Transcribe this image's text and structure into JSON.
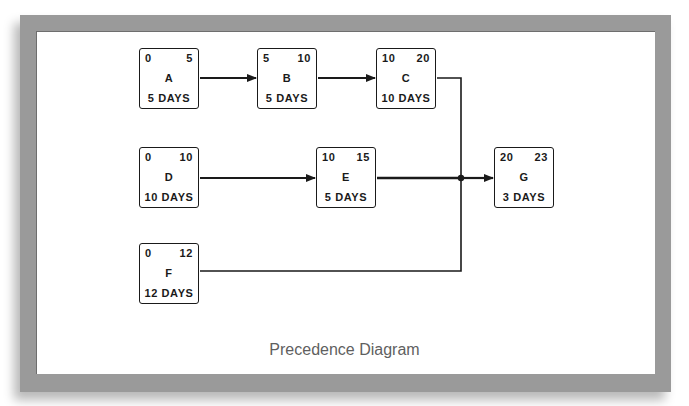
{
  "diagram": {
    "title": "Precedence Diagram",
    "colors": {
      "frame": "#9a9a9a",
      "line": "#1a1a1a",
      "caption": "#5f5f5f"
    },
    "nodes": [
      {
        "id": "A",
        "early_start": "0",
        "early_finish": "5",
        "name": "A",
        "duration": "5 DAYS"
      },
      {
        "id": "B",
        "early_start": "5",
        "early_finish": "10",
        "name": "B",
        "duration": "5 DAYS"
      },
      {
        "id": "C",
        "early_start": "10",
        "early_finish": "20",
        "name": "C",
        "duration": "10 DAYS"
      },
      {
        "id": "D",
        "early_start": "0",
        "early_finish": "10",
        "name": "D",
        "duration": "10 DAYS"
      },
      {
        "id": "E",
        "early_start": "10",
        "early_finish": "15",
        "name": "E",
        "duration": "5 DAYS"
      },
      {
        "id": "F",
        "early_start": "0",
        "early_finish": "12",
        "name": "F",
        "duration": "12 DAYS"
      },
      {
        "id": "G",
        "early_start": "20",
        "early_finish": "23",
        "name": "G",
        "duration": "3 DAYS"
      }
    ],
    "edges": [
      {
        "from": "A",
        "to": "B"
      },
      {
        "from": "B",
        "to": "C"
      },
      {
        "from": "D",
        "to": "E"
      },
      {
        "from": "C",
        "to": "G"
      },
      {
        "from": "E",
        "to": "G"
      },
      {
        "from": "F",
        "to": "G"
      }
    ]
  }
}
